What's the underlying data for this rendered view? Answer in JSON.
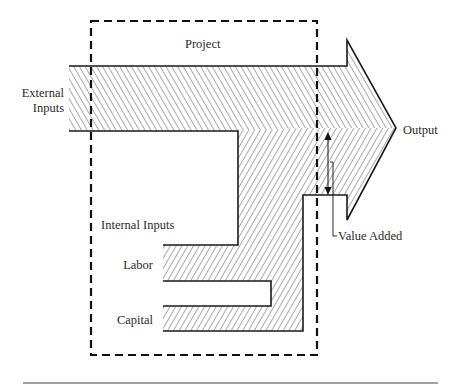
{
  "diagram": {
    "type": "flow-diagram",
    "boundary": {
      "label": "Project",
      "style": "dashed"
    },
    "labels": {
      "project": "Project",
      "external_inputs_line1": "External",
      "external_inputs_line2": "Inputs",
      "internal_inputs": "Internal Inputs",
      "labor": "Labor",
      "capital": "Capital",
      "output": "Output",
      "value_added": "Value Added"
    },
    "flows": [
      {
        "name": "External Inputs",
        "direction": "into project",
        "hatch": "backslash"
      },
      {
        "name": "Labor",
        "group": "Internal Inputs",
        "hatch": "slash"
      },
      {
        "name": "Capital",
        "group": "Internal Inputs",
        "hatch": "slash"
      },
      {
        "name": "Output",
        "direction": "out of project",
        "shape": "arrow"
      }
    ],
    "annotations": [
      {
        "name": "Value Added",
        "marker": "double-headed arrow spanning output minus external inputs"
      }
    ],
    "colors": {
      "ink": "#1a1a1a",
      "background": "#ffffff",
      "hatch": "#555555"
    }
  }
}
